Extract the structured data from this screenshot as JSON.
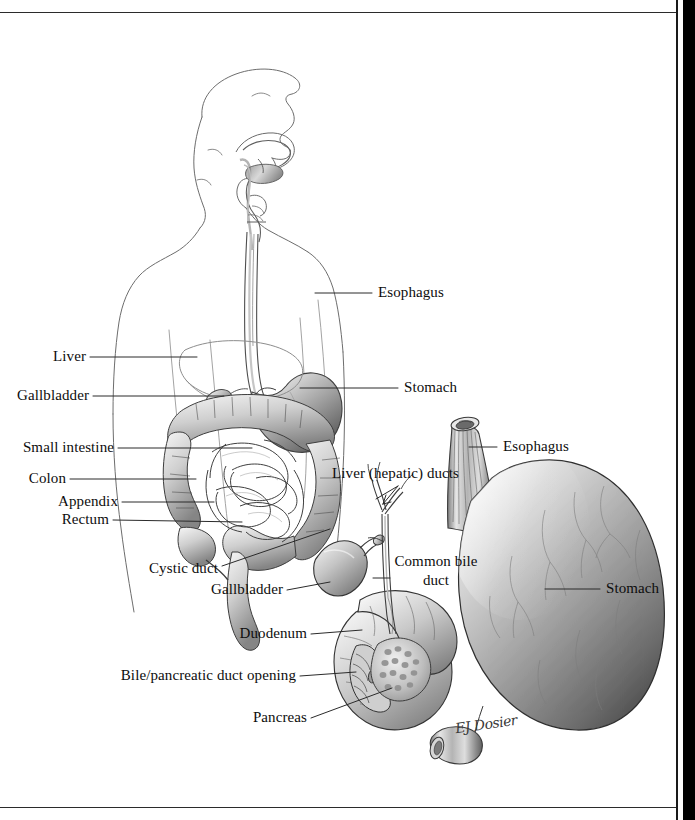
{
  "page": {
    "background_color": "#ffffff",
    "ink_color": "#111111",
    "has_top_rule": true,
    "has_bottom_rule": true,
    "scan_gutter_side": "right"
  },
  "figures": [
    {
      "id": "upper-figure",
      "name": "head-torso-digestive-overview",
      "description": "Lateral silhouette of head, neck and torso with pharynx, esophagus, stomach, liver, gallbladder, small intestine, colon, appendix and rectum"
    },
    {
      "id": "lower-figure",
      "name": "stomach-duodenum-biliary-detail",
      "description": "Enlarged detail of esophagus, stomach, duodenum, gallbladder, cystic duct, hepatic ducts, common bile duct and pancreas"
    }
  ],
  "labels": {
    "upper_left": [
      {
        "text": "Liver",
        "name": "label-liver"
      },
      {
        "text": "Gallbladder",
        "name": "label-gallbladder"
      },
      {
        "text": "Small intestine",
        "name": "label-small-intestine"
      },
      {
        "text": "Colon",
        "name": "label-colon"
      },
      {
        "text": "Appendix",
        "name": "label-appendix"
      },
      {
        "text": "Rectum",
        "name": "label-rectum"
      }
    ],
    "upper_right": [
      {
        "text": "Esophagus",
        "name": "label-esophagus-upper"
      },
      {
        "text": "Stomach",
        "name": "label-stomach-upper"
      }
    ],
    "lower_left": [
      {
        "text": "Cystic duct",
        "name": "label-cystic-duct"
      },
      {
        "text": "Gallbladder",
        "name": "label-gallbladder-detail"
      },
      {
        "text": "Duodenum",
        "name": "label-duodenum"
      },
      {
        "text": "Bile/pancreatic duct opening",
        "name": "label-bile-pancreatic-duct-opening"
      },
      {
        "text": "Pancreas",
        "name": "label-pancreas"
      }
    ],
    "lower_center": [
      {
        "text": "Liver (hepatic) ducts",
        "name": "label-liver-hepatic-ducts"
      },
      {
        "text": "Common bile",
        "text2": "duct",
        "name": "label-common-bile-duct"
      }
    ],
    "lower_right": [
      {
        "text": "Esophagus",
        "name": "label-esophagus-detail"
      },
      {
        "text": "Stomach",
        "name": "label-stomach-detail"
      }
    ]
  },
  "signature": {
    "text": "EJ Dosier",
    "name": "artist-signature"
  }
}
